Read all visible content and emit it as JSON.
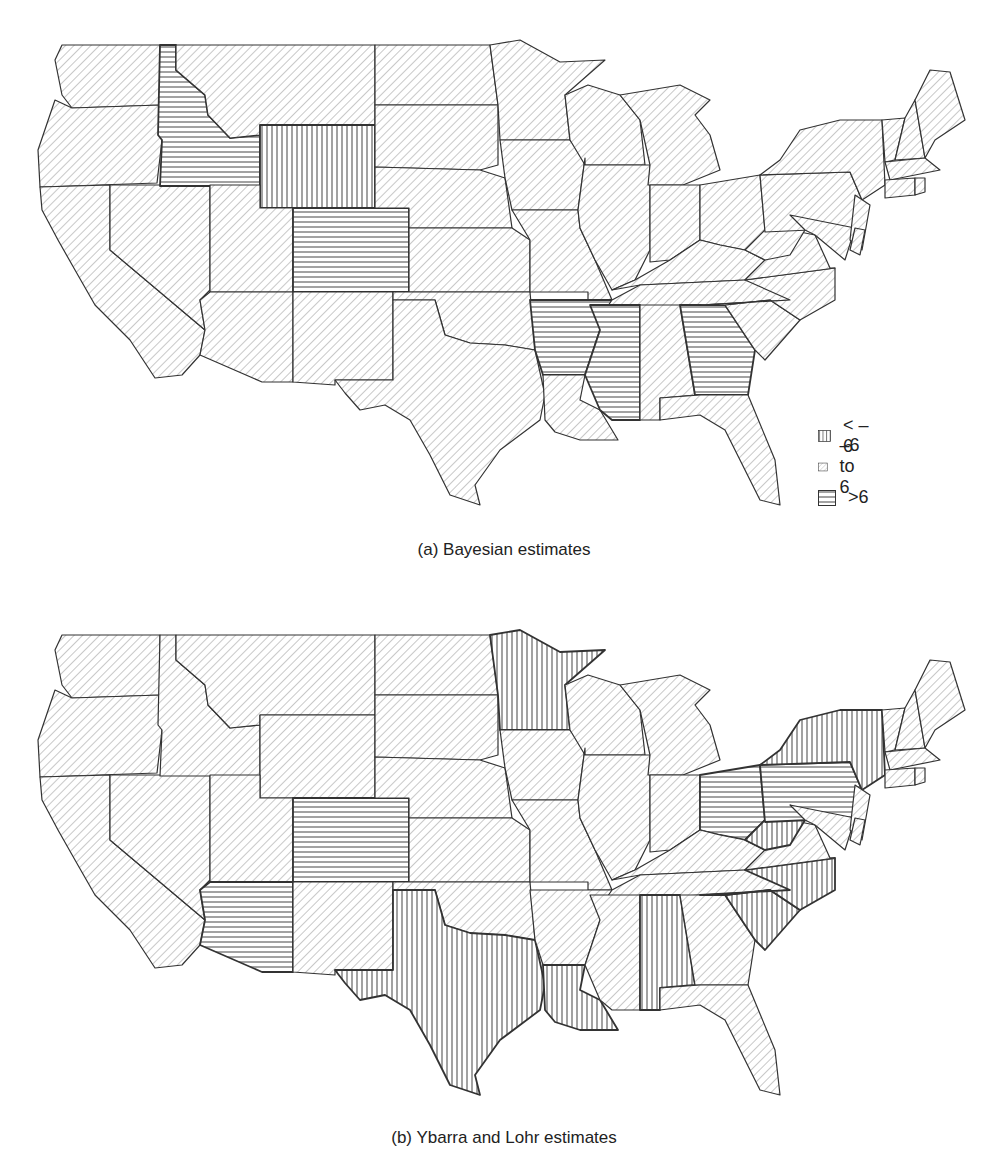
{
  "figure": {
    "panels": [
      {
        "id": "a",
        "caption": "(a) Bayesian estimates",
        "categories_by_state": {
          "ID": "gt6",
          "WY": "lt-6",
          "CO": "gt6",
          "AR": "gt6",
          "MS": "gt6",
          "GA": "gt6"
        },
        "default_category": "mid"
      },
      {
        "id": "b",
        "caption": "(b) Ybarra and Lohr estimates",
        "categories_by_state": {
          "MN": "lt-6",
          "CO": "gt6",
          "AZ": "gt6",
          "TX": "lt-6",
          "LA": "lt-6",
          "AL": "lt-6",
          "OH": "gt6",
          "PA": "gt6",
          "NY": "lt-6",
          "WV": "lt-6",
          "NC": "lt-6",
          "SC": "lt-6"
        },
        "default_category": "mid"
      }
    ],
    "legend": {
      "items": [
        {
          "key": "lt-6",
          "label": "< –6",
          "pattern": "vertical-lines"
        },
        {
          "key": "mid",
          "label": "–6 to 6",
          "pattern": "diagonal-lines"
        },
        {
          "key": "gt6",
          "label": ">6",
          "pattern": "horizontal-lines"
        }
      ]
    },
    "colors": {
      "stroke": "#333333",
      "hatch": "#555555",
      "diag": "#8a8a8a",
      "background": "#ffffff"
    }
  },
  "chart_data": {
    "type": "choropleth",
    "title": "",
    "legend": [
      "< -6",
      "-6 to 6",
      ">6"
    ],
    "panels": [
      {
        "caption": "(a) Bayesian estimates",
        "lt_minus6": [
          "WY"
        ],
        "gt6": [
          "ID",
          "CO",
          "AR",
          "MS",
          "GA"
        ],
        "mid": "all other contiguous states"
      },
      {
        "caption": "(b) Ybarra and Lohr estimates",
        "lt_minus6": [
          "MN",
          "TX",
          "LA",
          "AL",
          "NY",
          "WV",
          "NC",
          "SC"
        ],
        "gt6": [
          "CO",
          "AZ",
          "OH",
          "PA"
        ],
        "mid": "all other contiguous states"
      }
    ]
  }
}
